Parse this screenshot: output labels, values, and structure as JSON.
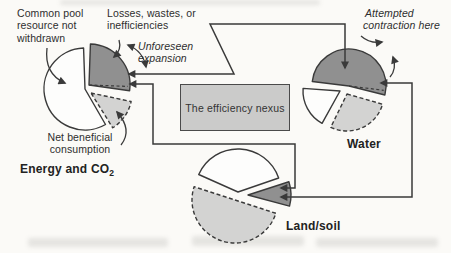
{
  "style": {
    "ink": "#3a3a3a",
    "paper": "#fbfaf7",
    "dark_fill": "#909090",
    "light_fill": "#d3d3d2",
    "white_fill": "#fdfdfc",
    "box_fill": "#cbcbca"
  },
  "annotations": {
    "common_pool": {
      "lines": [
        "Common pool",
        "resource not",
        "withdrawn"
      ]
    },
    "losses": {
      "lines": [
        "Losses, wastes, or",
        "inefficiencies"
      ]
    },
    "unforeseen": {
      "lines": [
        "Unforeseen",
        "expansion"
      ]
    },
    "attempted": {
      "lines": [
        "Attempted",
        "contraction here"
      ]
    },
    "net_beneficial": {
      "lines": [
        "Net beneficial",
        "consumption"
      ]
    }
  },
  "nexus_box": {
    "label": "The efficiency nexus"
  },
  "pie_titles": {
    "energy_main": "Energy and CO",
    "energy_sub": "2",
    "water": "Water",
    "land": "Land/soil"
  },
  "chart_data": [
    {
      "type": "pie",
      "id": "energy-co2",
      "title": "Energy and CO2",
      "cx": 85,
      "cy": 89,
      "r": 41,
      "segments": [
        {
          "name": "common-pool-resource-not-withdrawn",
          "approx_share_pct": 58,
          "start_deg": 150,
          "end_deg": 358,
          "fill": "#fdfdfc",
          "dashed": false,
          "dx": 0,
          "dy": 0
        },
        {
          "name": "losses-wastes-inefficiencies",
          "approx_share_pct": 27,
          "start_deg": 2,
          "end_deg": 98,
          "fill": "#909090",
          "dashed": false,
          "dx": 4,
          "dy": -4,
          "prev_boundary_deg": 92
        },
        {
          "name": "net-beneficial-consumption",
          "approx_share_pct": 13,
          "start_deg": 102,
          "end_deg": 148,
          "fill": "#d3d3d2",
          "dashed": true,
          "dx": 6,
          "dy": 4
        }
      ]
    },
    {
      "type": "pie",
      "id": "water",
      "title": "Water",
      "cx": 346,
      "cy": 90,
      "r": 37,
      "segments": [
        {
          "name": "losses-wastes-inefficiencies",
          "approx_share_pct": 52,
          "start_deg": 277,
          "end_deg": 464,
          "fill": "#909090",
          "dashed": false,
          "dx": 3,
          "dy": -4,
          "prev_boundary_deg": 97
        },
        {
          "name": "common-pool-resource-not-withdrawn",
          "approx_share_pct": 18,
          "start_deg": 209,
          "end_deg": 274,
          "fill": "#fdfdfc",
          "dashed": false,
          "dx": -6,
          "dy": 1
        },
        {
          "name": "net-beneficial-consumption",
          "approx_share_pct": 28,
          "start_deg": 106,
          "end_deg": 206,
          "fill": "#d3d3d2",
          "dashed": true,
          "dx": 1,
          "dy": 4
        }
      ]
    },
    {
      "type": "pie",
      "id": "land-soil",
      "title": "Land/soil",
      "cx": 238,
      "cy": 196,
      "r": 43,
      "segments": [
        {
          "name": "common-pool-resource-not-withdrawn",
          "approx_share_pct": 38,
          "start_deg": 294,
          "end_deg": 431,
          "fill": "#fdfdfc",
          "dashed": false,
          "dx": 0,
          "dy": -4
        },
        {
          "name": "losses-wastes-inefficiencies",
          "approx_share_pct": 9,
          "start_deg": 72,
          "end_deg": 105,
          "fill": "#909090",
          "dashed": false,
          "dx": 10,
          "dy": -1
        },
        {
          "name": "net-beneficial-consumption",
          "approx_share_pct": 50,
          "start_deg": 108,
          "end_deg": 288,
          "fill": "#d3d3d2",
          "dashed": true,
          "dx": -3,
          "dy": 4
        }
      ]
    }
  ],
  "connectors": [
    {
      "name": "water-energy-link",
      "heads": "both",
      "points": [
        [
          129,
          74
        ],
        [
          234,
          74
        ],
        [
          210,
          24
        ],
        [
          345,
          24
        ],
        [
          345,
          68
        ]
      ]
    },
    {
      "name": "land-energy-link",
      "heads": "both",
      "points": [
        [
          130,
          84
        ],
        [
          153,
          84
        ],
        [
          153,
          144
        ],
        [
          295,
          144
        ],
        [
          295,
          188
        ],
        [
          281,
          188
        ]
      ]
    },
    {
      "name": "water-land-link",
      "heads": "both",
      "points": [
        [
          381,
          83
        ],
        [
          412,
          83
        ],
        [
          412,
          197
        ],
        [
          281,
          197
        ]
      ]
    }
  ],
  "curved_arrows": [
    {
      "name": "common-pool-pointer-arrow",
      "heads": "end",
      "d": [
        [
          47,
          48
        ],
        [
          44,
          74
        ],
        [
          65,
          83
        ]
      ]
    },
    {
      "name": "losses-pointer-arrow",
      "heads": "end",
      "d": [
        [
          119,
          40
        ],
        [
          122,
          50
        ],
        [
          114,
          57
        ]
      ]
    },
    {
      "name": "unforeseen-expansion-arrow",
      "heads": "both",
      "d": [
        [
          128,
          45
        ],
        [
          143,
          51
        ],
        [
          146,
          67
        ]
      ]
    },
    {
      "name": "attempted-contraction-arrow-top",
      "heads": "end",
      "d": [
        [
          361,
          36
        ],
        [
          370,
          44
        ],
        [
          382,
          42
        ]
      ]
    },
    {
      "name": "attempted-contraction-arrow-right",
      "heads": "end",
      "d": [
        [
          390,
          77
        ],
        [
          397,
          69
        ],
        [
          393,
          57
        ]
      ]
    },
    {
      "name": "net-beneficial-pointer-arrow",
      "heads": "end",
      "d": [
        [
          121,
          145
        ],
        [
          133,
          130
        ],
        [
          117,
          112
        ]
      ]
    }
  ]
}
